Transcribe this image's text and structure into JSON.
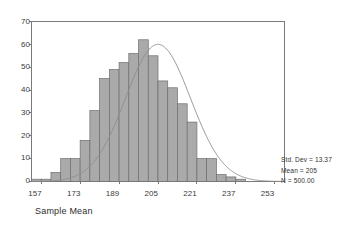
{
  "chart_data": {
    "type": "bar",
    "title": "",
    "subtitle": "",
    "xlabel": "Sample Mean",
    "ylabel": "",
    "xlim": [
      153,
      257
    ],
    "ylim": [
      0,
      70
    ],
    "grid": false,
    "legend_position": "none",
    "bin_width": 4,
    "x_tick_labels": [
      "157",
      "173",
      "189",
      "205",
      "221",
      "237",
      "253"
    ],
    "x_tick_values": [
      157,
      173,
      189,
      205,
      221,
      237,
      253
    ],
    "y_tick_labels": [
      "0",
      "10",
      "20",
      "30",
      "40",
      "50",
      "60",
      "70"
    ],
    "y_tick_values": [
      0,
      10,
      20,
      30,
      40,
      50,
      60,
      70
    ],
    "categories": [
      155,
      159,
      163,
      167,
      171,
      175,
      179,
      183,
      187,
      191,
      195,
      199,
      203,
      207,
      211,
      215,
      219,
      223,
      227,
      231,
      235,
      239,
      243,
      247,
      251
    ],
    "values": [
      1,
      1,
      4,
      10,
      10,
      18,
      31,
      45,
      49,
      52,
      56,
      62,
      55,
      44,
      41,
      34,
      26,
      10,
      10,
      3,
      2,
      1,
      0,
      0,
      0
    ],
    "series": [
      {
        "name": "Frequency",
        "values": [
          1,
          1,
          4,
          10,
          10,
          18,
          31,
          45,
          49,
          52,
          56,
          62,
          55,
          44,
          41,
          34,
          26,
          10,
          10,
          3,
          2,
          1,
          0,
          0,
          0
        ]
      },
      {
        "name": "Normal curve",
        "type": "line",
        "mean": 205,
        "std_dev": 13.37,
        "n": 500,
        "peak_value": 60
      }
    ],
    "annotations": [
      "Std. Dev = 13.37",
      "Mean = 205",
      "N = 500.00"
    ],
    "colors": {
      "bar_fill": "#aaaaaa",
      "bar_stroke": "#6e6e6e",
      "curve": "#8c8c8c",
      "axis": "#7a7a7a",
      "text": "#333333",
      "background": "#ffffff"
    }
  },
  "stats": {
    "std_dev": "Std. Dev = 13.37",
    "mean": "Mean = 205",
    "n": "N = 500.00"
  },
  "axes": {
    "x_title": "Sample Mean",
    "y_ticks": [
      "70",
      "60",
      "50",
      "40",
      "30",
      "20",
      "10",
      "0"
    ],
    "x_ticks": [
      "157",
      "173",
      "189",
      "205",
      "221",
      "237",
      "253"
    ]
  }
}
